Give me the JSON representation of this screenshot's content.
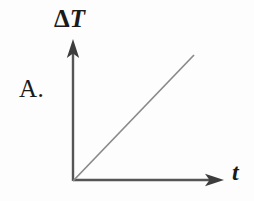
{
  "figure": {
    "item_label": "A.",
    "background_color": "#fdfdfd",
    "width": 254,
    "height": 201
  },
  "axes": {
    "y_label_delta": "Δ",
    "y_label_variable": "T",
    "y_label_full": "ΔT",
    "x_label": "t",
    "axis_color": "#555555",
    "origin": {
      "x": 73,
      "y": 181
    },
    "y_axis_tip": {
      "x": 73,
      "y": 39
    },
    "x_axis_tip": {
      "x": 224,
      "y": 180
    },
    "arrowhead_style": "barbed"
  },
  "chart_data": {
    "type": "line",
    "title": "",
    "xlabel": "t",
    "ylabel": "ΔT",
    "grid": false,
    "legend": null,
    "axis_ticks": {
      "x": [],
      "y": []
    },
    "xlim": [
      0,
      1
    ],
    "ylim": [
      0,
      1
    ],
    "series": [
      {
        "name": "ΔT vs t",
        "color": "#8a8a8a",
        "description": "straight line of constant positive slope through the origin",
        "x": [
          0,
          1
        ],
        "y": [
          0,
          1
        ],
        "pixel_start": {
          "x": 73,
          "y": 181
        },
        "pixel_end": {
          "x": 194,
          "y": 55
        }
      }
    ]
  }
}
